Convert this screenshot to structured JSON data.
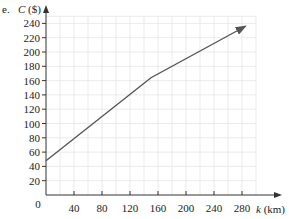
{
  "question_label": "e.",
  "chart_data": {
    "type": "line",
    "title": "",
    "xlabel": "k (km)",
    "ylabel": "C ($)",
    "xlabel_var": "k",
    "xlabel_unit": "(km)",
    "ylabel_var": "C",
    "ylabel_unit": "($)",
    "origin_label": "0",
    "xlim": [
      0,
      300
    ],
    "ylim": [
      0,
      250
    ],
    "x_ticks": [
      40,
      80,
      120,
      160,
      200,
      240,
      280
    ],
    "y_ticks": [
      20,
      40,
      60,
      80,
      100,
      120,
      140,
      160,
      180,
      200,
      220,
      240
    ],
    "grid": true,
    "series": [
      {
        "name": "C",
        "x": [
          0,
          150,
          285
        ],
        "y": [
          48,
          164,
          236
        ],
        "color": "#555555",
        "end_arrow": true
      }
    ]
  },
  "colors": {
    "grid": "#e6e6e6",
    "axis": "#333333",
    "line": "#555555"
  }
}
